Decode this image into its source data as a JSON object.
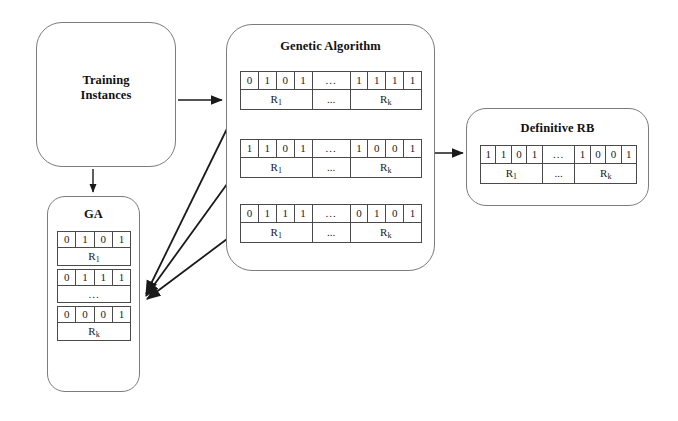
{
  "training_box": {
    "label_line1": "Training",
    "label_line2": "Instances"
  },
  "ga_box": {
    "title": "GA",
    "rules": [
      {
        "bits": [
          "0",
          "1",
          "0",
          "1"
        ],
        "name": "R",
        "sub": "1"
      },
      {
        "bits": [
          "0",
          "1",
          "1",
          "1"
        ],
        "name": "",
        "sub": ""
      }
    ],
    "ellipsis": "...",
    "last_rule": {
      "bits": [
        "0",
        "0",
        "0",
        "1"
      ],
      "name": "R",
      "sub": "k"
    }
  },
  "genetic_box": {
    "title": "Genetic Algorithm",
    "gap": "...",
    "name_first": "R",
    "sub_first": "1",
    "name_last": "R",
    "sub_last": "k",
    "chromosomes": [
      {
        "left_bits": [
          "0",
          "1",
          "0",
          "1"
        ],
        "right_bits": [
          "1",
          "1",
          "1",
          "1"
        ]
      },
      {
        "left_bits": [
          "1",
          "1",
          "0",
          "1"
        ],
        "right_bits": [
          "1",
          "0",
          "0",
          "1"
        ]
      },
      {
        "left_bits": [
          "0",
          "1",
          "1",
          "1"
        ],
        "right_bits": [
          "0",
          "1",
          "0",
          "1"
        ]
      }
    ]
  },
  "rb_box": {
    "title": "Definitive RB",
    "gap": "...",
    "name_first": "R",
    "sub_first": "1",
    "name_last": "R",
    "sub_last": "k",
    "chromosome": {
      "left_bits": [
        "1",
        "1",
        "0",
        "1"
      ],
      "right_bits": [
        "1",
        "0",
        "0",
        "1"
      ]
    }
  },
  "colors": {
    "box_border": "#7c7c7c",
    "cell_border": "#4a4a4a",
    "arrow": "#1a1a1a",
    "text": "#111111",
    "background": "#ffffff"
  },
  "arrows": [
    {
      "name": "training-to-genetic",
      "from": "Training Instances",
      "to": "Genetic Algorithm"
    },
    {
      "name": "training-to-ga",
      "from": "Training Instances",
      "to": "GA"
    },
    {
      "name": "chromosome-1-to-ga",
      "from": "Genetic Algorithm chromosome 1",
      "to": "GA"
    },
    {
      "name": "chromosome-2-to-ga",
      "from": "Genetic Algorithm chromosome 2",
      "to": "GA"
    },
    {
      "name": "chromosome-3-to-ga",
      "from": "Genetic Algorithm chromosome 3",
      "to": "GA"
    },
    {
      "name": "genetic-to-rb",
      "from": "Genetic Algorithm",
      "to": "Definitive RB"
    }
  ]
}
